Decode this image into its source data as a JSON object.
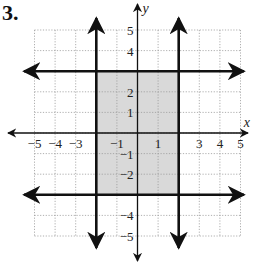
{
  "problem": {
    "number": "3."
  },
  "graph": {
    "x_axis_label": "x",
    "y_axis_label": "y",
    "x_range": [
      -5,
      5
    ],
    "y_range": [
      -5,
      5
    ],
    "x_tick_labels": [
      {
        "value": -5,
        "label": "−5"
      },
      {
        "value": -4,
        "label": "−4"
      },
      {
        "value": -3,
        "label": "−3"
      },
      {
        "value": -1,
        "label": "−1"
      },
      {
        "value": 1,
        "label": "1"
      },
      {
        "value": 3,
        "label": "3"
      },
      {
        "value": 4,
        "label": "4"
      },
      {
        "value": 5,
        "label": "5"
      }
    ],
    "y_tick_labels": [
      {
        "value": 5,
        "label": "5"
      },
      {
        "value": 4,
        "label": "4"
      },
      {
        "value": 2,
        "label": "2"
      },
      {
        "value": 1,
        "label": "1"
      },
      {
        "value": -1,
        "label": "−1"
      },
      {
        "value": -2,
        "label": "−2"
      },
      {
        "value": -4,
        "label": "−4"
      },
      {
        "value": -5,
        "label": "−5"
      }
    ],
    "boundary_lines": [
      {
        "type": "vertical",
        "x": -2
      },
      {
        "type": "vertical",
        "x": 2
      },
      {
        "type": "horizontal",
        "y": 3
      },
      {
        "type": "horizontal",
        "y": -3
      }
    ],
    "shaded_region": {
      "x_min": -2,
      "x_max": 2,
      "y_min": -3,
      "y_max": 3
    },
    "colors": {
      "shade": "#d9d9d9",
      "grid": "#9a9a9a",
      "line": "#111111"
    }
  }
}
